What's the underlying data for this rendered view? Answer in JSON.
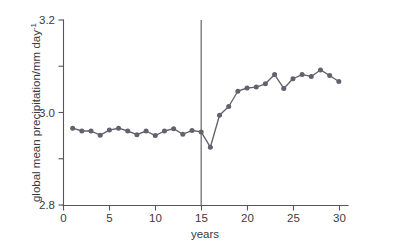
{
  "chart_data": {
    "type": "line",
    "title": "",
    "xlabel": "years",
    "ylabel": "global mean precipitation/mm day",
    "ylabel_exponent": "-1",
    "xlim": [
      0,
      31
    ],
    "ylim": [
      2.8,
      3.2
    ],
    "grid": false,
    "legend": null,
    "xticks": [
      0,
      5,
      10,
      15,
      20,
      25,
      30
    ],
    "xtick_labels": [
      "0",
      "5",
      "10",
      "15",
      "20",
      "25",
      "30"
    ],
    "yticks": [
      2.8,
      3.0,
      3.2
    ],
    "ytick_labels": [
      "2.8",
      "3.0",
      "3.2"
    ],
    "yticks_minor": [
      2.9,
      3.1
    ],
    "series": [
      {
        "name": "global mean precipitation",
        "color": "#62626c",
        "marker": "circle",
        "x": [
          1,
          2,
          3,
          4,
          5,
          6,
          7,
          8,
          9,
          10,
          11,
          12,
          13,
          14,
          15,
          16,
          17,
          18,
          19,
          20,
          21,
          22,
          23,
          24,
          25,
          26,
          27,
          28,
          29,
          30
        ],
        "values": [
          2.966,
          2.96,
          2.96,
          2.951,
          2.962,
          2.966,
          2.96,
          2.952,
          2.96,
          2.95,
          2.96,
          2.965,
          2.953,
          2.961,
          2.958,
          2.925,
          2.994,
          3.013,
          3.046,
          3.053,
          3.055,
          3.062,
          3.082,
          3.052,
          3.073,
          3.082,
          3.078,
          3.092,
          3.08,
          3.067
        ]
      }
    ],
    "annotations": [
      {
        "type": "vline",
        "name": "intervention-marker",
        "x": 15,
        "color": "#55555c"
      }
    ]
  }
}
